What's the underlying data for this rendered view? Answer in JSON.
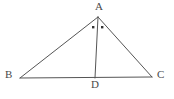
{
  "figure": {
    "background_color": "#ffffff",
    "stroke_color": "#555555",
    "label_color": "#4a4a4a",
    "stroke_width": 1,
    "canvas": {
      "width": 174,
      "height": 99
    },
    "vertices": [
      {
        "name": "A",
        "label": "A",
        "x": 98,
        "y": 17,
        "label_x": 99,
        "label_y": 7
      },
      {
        "name": "B",
        "label": "B",
        "x": 20,
        "y": 78,
        "label_x": 9,
        "label_y": 75
      },
      {
        "name": "C",
        "label": "C",
        "x": 152,
        "y": 77,
        "label_x": 161,
        "label_y": 75
      },
      {
        "name": "D",
        "label": "D",
        "x": 95,
        "y": 78,
        "label_x": 95,
        "label_y": 85
      }
    ],
    "segments": [
      {
        "name": "segment-AB",
        "from": "A",
        "to": "B",
        "x1": 98,
        "y1": 17,
        "x2": 20,
        "y2": 78
      },
      {
        "name": "segment-AC",
        "from": "A",
        "to": "C",
        "x1": 98,
        "y1": 17,
        "x2": 152,
        "y2": 77
      },
      {
        "name": "segment-BC",
        "from": "B",
        "to": "C",
        "x1": 20,
        "y1": 78,
        "x2": 152,
        "y2": 77
      },
      {
        "name": "segment-AD",
        "from": "A",
        "to": "D",
        "x1": 98,
        "y1": 17,
        "x2": 95,
        "y2": 78
      }
    ],
    "angle_marks": [
      {
        "name": "angle-mark-BAD",
        "shape": "square-dot",
        "x": 93,
        "y": 27,
        "size": 2
      },
      {
        "name": "angle-mark-DAC",
        "shape": "square-dot",
        "x": 102,
        "y": 27,
        "size": 2
      }
    ]
  }
}
